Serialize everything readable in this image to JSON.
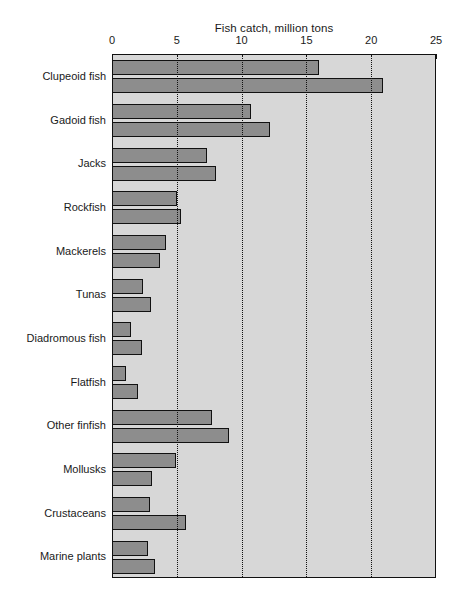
{
  "chart_data": {
    "type": "bar",
    "orientation": "horizontal",
    "title": "Fish catch, million tons",
    "xlabel": "",
    "ylabel": "",
    "xlim": [
      0,
      25
    ],
    "xticks": [
      0,
      5,
      10,
      15,
      20,
      25
    ],
    "grid": true,
    "grid_style": "dotted vertical",
    "legend": null,
    "bars_per_category": 2,
    "categories": [
      "Clupeoid fish",
      "Gadoid fish",
      "Jacks",
      "Rockfish",
      "Mackerels",
      "Tunas",
      "Diadromous fish",
      "Flatfish",
      "Other finfish",
      "Mollusks",
      "Crustaceans",
      "Marine plants"
    ],
    "series": [
      {
        "name": "first",
        "values": [
          16.0,
          10.7,
          7.3,
          5.0,
          4.2,
          2.4,
          1.5,
          1.1,
          7.7,
          4.9,
          2.9,
          2.8
        ]
      },
      {
        "name": "second",
        "values": [
          20.9,
          12.2,
          8.0,
          5.3,
          3.7,
          3.0,
          2.3,
          2.0,
          9.0,
          3.1,
          5.7,
          3.3
        ]
      }
    ],
    "colors": {
      "bar_fill": "#8d8d8d",
      "bar_edge": "#111111",
      "plot_background": "#d7d7d7",
      "axis": "#111111",
      "text": "#1a1a1a",
      "page_background": "#ffffff"
    }
  }
}
